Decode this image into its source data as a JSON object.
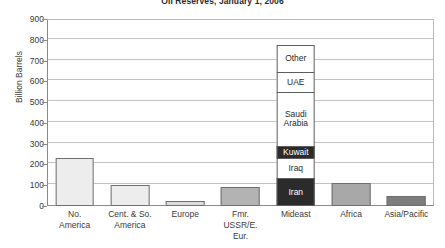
{
  "chart_data": {
    "type": "bar",
    "title": "Oil Reserves, January 1, 2006",
    "xlabel": "",
    "ylabel": "Billion Barrels",
    "ylim": [
      0,
      900
    ],
    "ytick_step": 100,
    "yticks": [
      "900",
      "800",
      "700",
      "600",
      "500",
      "400",
      "300",
      "200",
      "100",
      "0"
    ],
    "grid": true,
    "legend": "none",
    "categories": [
      "No.\nAmerica",
      "Cent. & So.\nAmerica",
      "Europe",
      "Fmr.\nUSSR/E.\nEur.",
      "Mideast",
      "Africa",
      "Asia/Pacific"
    ],
    "values": [
      230,
      100,
      25,
      90,
      800,
      110,
      50
    ],
    "series": [
      {
        "name": "Oil Reserves",
        "values": [
          230,
          100,
          25,
          90,
          800,
          110,
          50
        ]
      }
    ],
    "stacked_category": "Mideast",
    "stack_segments": [
      {
        "label": "Iran",
        "value": 135,
        "fill": "#2b2b2b",
        "text_color": "#ffffff"
      },
      {
        "label": "Iraq",
        "value": 100,
        "fill": "#ffffff",
        "text_color": "#2b2b2b"
      },
      {
        "label": "Kuwait",
        "value": 65,
        "fill": "#2b2b2b",
        "text_color": "#ffffff"
      },
      {
        "label": "Saudi\nArabia",
        "value": 265,
        "fill": "#ffffff",
        "text_color": "#2b2b2b"
      },
      {
        "label": "UAE",
        "value": 100,
        "fill": "#ffffff",
        "text_color": "#2b2b2b"
      },
      {
        "label": "Other",
        "value": 135,
        "fill": "#ffffff",
        "text_color": "#2b2b2b"
      }
    ],
    "bar_fills": [
      "#ededed",
      "#ededed",
      "#dcdcdc",
      "#b3b3b3",
      "#ffffff",
      "#a8a8a8",
      "#7d7d7d"
    ],
    "colors": {
      "axis": "#8a8a8a",
      "gridline": "#c3c3c3",
      "bar_outline": "#6f6f6f",
      "text": "#3a3a3a",
      "background": "#ffffff"
    }
  }
}
